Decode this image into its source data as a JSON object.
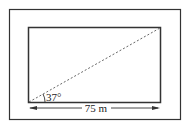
{
  "diagram": {
    "type": "geometry-rectangle-diagonal",
    "angle_label": "37°",
    "width_label": "75 m",
    "colors": {
      "stroke": "#333333",
      "dashed": "#555555",
      "background": "#ffffff"
    }
  }
}
